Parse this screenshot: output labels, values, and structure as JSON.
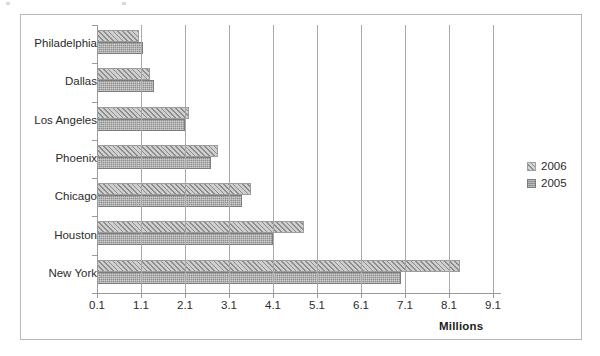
{
  "chart_data": {
    "type": "bar",
    "orientation": "horizontal",
    "title": "",
    "xlabel": "Millions",
    "ylabel": "",
    "categories": [
      "Philadelphia",
      "Dallas",
      "Los Angeles",
      "Phoenix",
      "Chicago",
      "Houston",
      "New York"
    ],
    "series": [
      {
        "name": "2006",
        "values": [
          1.05,
          1.3,
          2.2,
          2.85,
          3.6,
          4.8,
          8.35
        ]
      },
      {
        "name": "2005",
        "values": [
          1.15,
          1.4,
          2.1,
          2.7,
          3.4,
          4.1,
          7.0
        ]
      }
    ],
    "xticks": [
      "0.1",
      "1.1",
      "2.1",
      "3.1",
      "4.1",
      "5.1",
      "6.1",
      "7.1",
      "8.1",
      "9.1"
    ],
    "xtick_values": [
      0.1,
      1.1,
      2.1,
      3.1,
      4.1,
      5.1,
      6.1,
      7.1,
      8.1,
      9.1
    ],
    "xlim": [
      0.1,
      9.1
    ],
    "grid": "vertical",
    "legend_position": "right",
    "legend": [
      "2006",
      "2005"
    ],
    "colors": {
      "series_2006": "#cfcfcf",
      "series_2005": "#8e8e8e",
      "gridline": "#a8a8a8",
      "border": "#b9b9b9",
      "text": "#2b2b2b",
      "background": "#ffffff"
    }
  },
  "axis": {
    "x_title": "Millions"
  }
}
